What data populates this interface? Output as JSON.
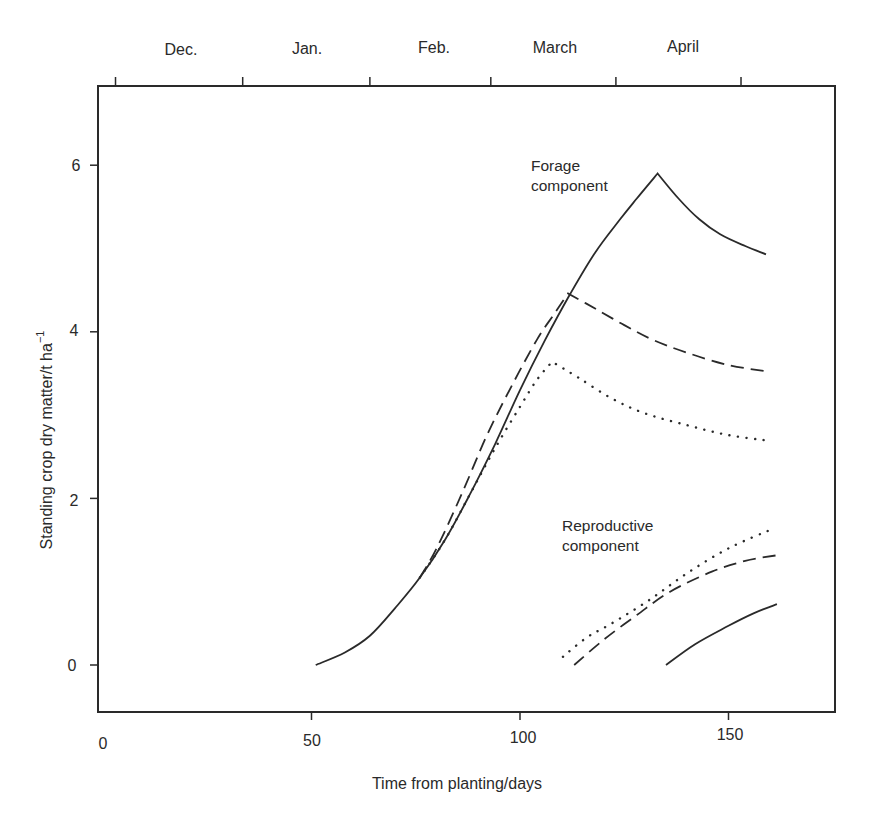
{
  "chart_data": {
    "type": "line",
    "title": "",
    "xlabel": "Time from planting/days",
    "ylabel": "Standing crop dry matter/t ha",
    "ylabel_superscript": "−1",
    "xlim": [
      0,
      175
    ],
    "ylim": [
      -0.6,
      7
    ],
    "xticks": [
      0,
      50,
      100,
      150
    ],
    "yticks": [
      0,
      2,
      4,
      6
    ],
    "grid": false,
    "legend": "none (inline annotations)",
    "top_axis": {
      "labels": [
        "Dec.",
        "Jan.",
        "Feb.",
        "March",
        "April"
      ],
      "tick_days": [
        3,
        33.5,
        64,
        93,
        123,
        153
      ]
    },
    "annotations": [
      {
        "text_line1": "Forage",
        "text_line2": "component",
        "x": 101,
        "y": 6.0
      },
      {
        "text_line1": "Reproductive",
        "text_line2": "component",
        "x": 103,
        "y": 1.8
      }
    ],
    "series": [
      {
        "name": "Forage (solid)",
        "style": "solid",
        "component": "forage",
        "points": [
          [
            51,
            0
          ],
          [
            58,
            0.15
          ],
          [
            64,
            0.35
          ],
          [
            70,
            0.68
          ],
          [
            76,
            1.05
          ],
          [
            82,
            1.5
          ],
          [
            88,
            2.05
          ],
          [
            94,
            2.65
          ],
          [
            100,
            3.3
          ],
          [
            106,
            3.9
          ],
          [
            112,
            4.45
          ],
          [
            118,
            4.95
          ],
          [
            124,
            5.35
          ],
          [
            128,
            5.6
          ],
          [
            133,
            5.9
          ],
          [
            138,
            5.6
          ],
          [
            143,
            5.35
          ],
          [
            148,
            5.17
          ],
          [
            154,
            5.03
          ],
          [
            159,
            4.93
          ]
        ]
      },
      {
        "name": "Forage (dashed)",
        "style": "dashed",
        "component": "forage",
        "points": [
          [
            76,
            1.05
          ],
          [
            80,
            1.4
          ],
          [
            86,
            2.05
          ],
          [
            92,
            2.75
          ],
          [
            98,
            3.35
          ],
          [
            104,
            3.9
          ],
          [
            108,
            4.2
          ],
          [
            111.5,
            4.46
          ],
          [
            118,
            4.28
          ],
          [
            125,
            4.08
          ],
          [
            132,
            3.9
          ],
          [
            140,
            3.75
          ],
          [
            150,
            3.6
          ],
          [
            160,
            3.52
          ]
        ]
      },
      {
        "name": "Forage (dotted)",
        "style": "dotted",
        "component": "forage",
        "points": [
          [
            76,
            1.05
          ],
          [
            82,
            1.5
          ],
          [
            88,
            2.05
          ],
          [
            94,
            2.6
          ],
          [
            100,
            3.1
          ],
          [
            104,
            3.42
          ],
          [
            107.7,
            3.64
          ],
          [
            114,
            3.45
          ],
          [
            122,
            3.2
          ],
          [
            130,
            3.02
          ],
          [
            140,
            2.88
          ],
          [
            150,
            2.76
          ],
          [
            160,
            2.69
          ]
        ]
      },
      {
        "name": "Reproductive (dotted)",
        "style": "dotted",
        "component": "reproductive",
        "points": [
          [
            110.3,
            0.1
          ],
          [
            116,
            0.33
          ],
          [
            122,
            0.5
          ],
          [
            131,
            0.78
          ],
          [
            140,
            1.1
          ],
          [
            150,
            1.4
          ],
          [
            160.4,
            1.63
          ]
        ]
      },
      {
        "name": "Reproductive (dashed)",
        "style": "dashed",
        "component": "reproductive",
        "points": [
          [
            113,
            0.0
          ],
          [
            120,
            0.3
          ],
          [
            128,
            0.6
          ],
          [
            136,
            0.88
          ],
          [
            146,
            1.12
          ],
          [
            154,
            1.25
          ],
          [
            162,
            1.32
          ]
        ]
      },
      {
        "name": "Reproductive (solid)",
        "style": "solid",
        "component": "reproductive",
        "points": [
          [
            135,
            0.0
          ],
          [
            142,
            0.25
          ],
          [
            150,
            0.47
          ],
          [
            156,
            0.62
          ],
          [
            161.6,
            0.73
          ]
        ]
      }
    ]
  },
  "colors": {
    "ink": "#2a2a2a",
    "background": "#ffffff"
  }
}
